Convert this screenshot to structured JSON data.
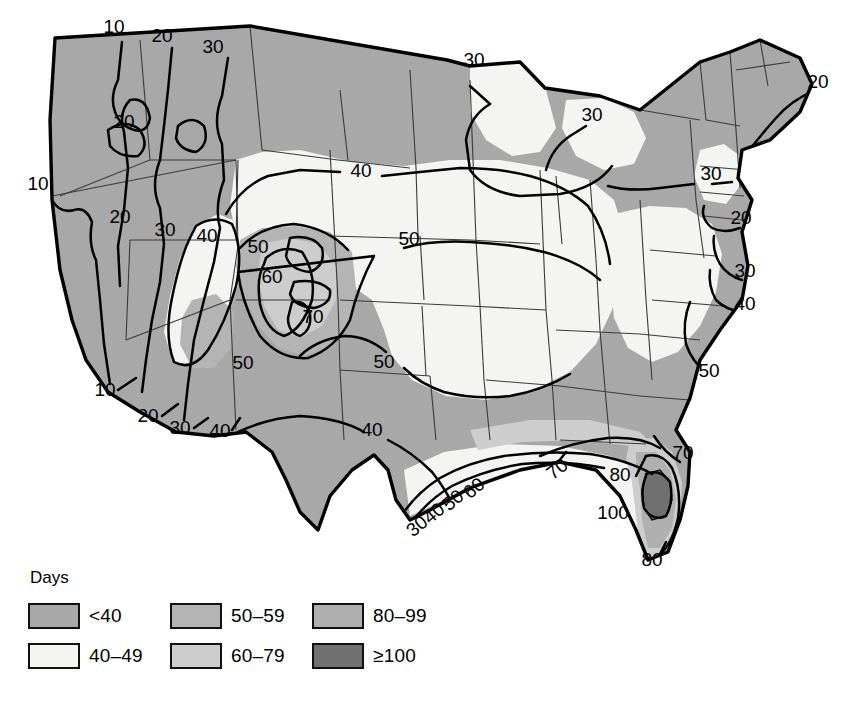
{
  "figure": {
    "kind": "thematic-contour-map",
    "region": "Contiguous United States",
    "variable": "Mean annual number of days with thunderstorms"
  },
  "legend": {
    "title": "Days",
    "items": [
      {
        "label": "<40",
        "color": "#a8a8a8",
        "order": 1
      },
      {
        "label": "40–49",
        "color": "#f4f4f2",
        "order": 2
      },
      {
        "label": "50–59",
        "color": "#b4b4b4",
        "order": 3
      },
      {
        "label": "60–79",
        "color": "#cdcdcd",
        "order": 4
      },
      {
        "label": "80–99",
        "color": "#b0b0b0",
        "order": 5
      },
      {
        "label": "≥100",
        "color": "#707070",
        "order": 6
      }
    ]
  },
  "map": {
    "outline_color": "#000000",
    "state_border_color": "#3a3a3a",
    "contour_color": "#000000",
    "background": "#ffffff"
  },
  "contour_labels": [
    {
      "id": "nw-top-10",
      "text": "10",
      "x": 114,
      "y": 33,
      "rotate": 0
    },
    {
      "id": "nw-top-20",
      "text": "20",
      "x": 162,
      "y": 42,
      "rotate": 0
    },
    {
      "id": "nw-top-30",
      "text": "30",
      "x": 213,
      "y": 53,
      "rotate": 0
    },
    {
      "id": "nw-inland-20",
      "text": "20",
      "x": 124,
      "y": 128,
      "rotate": 0
    },
    {
      "id": "west-10",
      "text": "10",
      "x": 38,
      "y": 190,
      "rotate": 0
    },
    {
      "id": "gb-20",
      "text": "20",
      "x": 120,
      "y": 223,
      "rotate": 0
    },
    {
      "id": "gb-30",
      "text": "30",
      "x": 165,
      "y": 236,
      "rotate": 0
    },
    {
      "id": "gb-40",
      "text": "40",
      "x": 207,
      "y": 242,
      "rotate": 0
    },
    {
      "id": "rockies-50",
      "text": "50",
      "x": 258,
      "y": 253,
      "rotate": 0
    },
    {
      "id": "rockies-60",
      "text": "60",
      "x": 272,
      "y": 283,
      "rotate": 0
    },
    {
      "id": "rockies-70",
      "text": "70",
      "x": 313,
      "y": 323,
      "rotate": 0
    },
    {
      "id": "sw-50",
      "text": "50",
      "x": 243,
      "y": 369,
      "rotate": 0
    },
    {
      "id": "plains-40",
      "text": "40",
      "x": 361,
      "y": 177,
      "rotate": 0
    },
    {
      "id": "plains-50",
      "text": "50",
      "x": 409,
      "y": 245,
      "rotate": 0
    },
    {
      "id": "south-50",
      "text": "50",
      "x": 384,
      "y": 368,
      "rotate": 0
    },
    {
      "id": "tx-40",
      "text": "40",
      "x": 372,
      "y": 436,
      "rotate": 0
    },
    {
      "id": "lakes-30a",
      "text": "30",
      "x": 474,
      "y": 66,
      "rotate": 0
    },
    {
      "id": "lakes-30b",
      "text": "30",
      "x": 592,
      "y": 121,
      "rotate": 0
    },
    {
      "id": "ne-20",
      "text": "20",
      "x": 818,
      "y": 88,
      "rotate": 0
    },
    {
      "id": "ny-30",
      "text": "30",
      "x": 711,
      "y": 180,
      "rotate": 0
    },
    {
      "id": "coast-20",
      "text": "20",
      "x": 741,
      "y": 224,
      "rotate": 0
    },
    {
      "id": "coast-30",
      "text": "30",
      "x": 745,
      "y": 277,
      "rotate": 0
    },
    {
      "id": "coast-40",
      "text": "40",
      "x": 745,
      "y": 310,
      "rotate": 0
    },
    {
      "id": "coast-50",
      "text": "50",
      "x": 709,
      "y": 377,
      "rotate": 0
    },
    {
      "id": "se-70",
      "text": "70",
      "x": 683,
      "y": 459,
      "rotate": 0
    },
    {
      "id": "fl-80a",
      "text": "80",
      "x": 620,
      "y": 481,
      "rotate": 0
    },
    {
      "id": "fl-100",
      "text": "100",
      "x": 613,
      "y": 519,
      "rotate": 0
    },
    {
      "id": "fl-80b",
      "text": "80",
      "x": 652,
      "y": 566,
      "rotate": 0
    },
    {
      "id": "gulf-70",
      "text": "70",
      "x": 561,
      "y": 474,
      "rotate": -38
    },
    {
      "id": "gulf-60",
      "text": "60",
      "x": 478,
      "y": 493,
      "rotate": -40
    },
    {
      "id": "gulf-50",
      "text": "50",
      "x": 457,
      "y": 505,
      "rotate": -40
    },
    {
      "id": "gulf-40",
      "text": "40",
      "x": 438,
      "y": 518,
      "rotate": -40
    },
    {
      "id": "gulf-30",
      "text": "30",
      "x": 421,
      "y": 531,
      "rotate": -40
    },
    {
      "id": "sw-b-10",
      "text": "10",
      "x": 105,
      "y": 396,
      "rotate": 0
    },
    {
      "id": "sw-b-20",
      "text": "20",
      "x": 148,
      "y": 422,
      "rotate": 0
    },
    {
      "id": "sw-b-30",
      "text": "30",
      "x": 180,
      "y": 434,
      "rotate": 0
    },
    {
      "id": "sw-b-40",
      "text": "40",
      "x": 220,
      "y": 437,
      "rotate": 0
    }
  ]
}
